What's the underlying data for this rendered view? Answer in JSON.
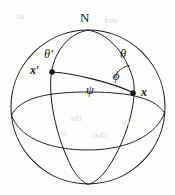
{
  "figure": {
    "type": "geometry-diagram",
    "background_color": "#fdfdfc",
    "stroke_color": "#1a1a1a",
    "canvas": {
      "width": 175,
      "height": 195
    }
  },
  "sphere": {
    "center_x": 88,
    "center_y": 107,
    "radius": 77,
    "name": "sphere-outline"
  },
  "poles": {
    "north": {
      "label": "N",
      "x": 88,
      "y": 30,
      "label_x": 80,
      "label_y": 11
    },
    "south": {
      "label": "",
      "x": 88,
      "y": 184
    }
  },
  "points": [
    {
      "id": "x-prime",
      "label": "x′",
      "x": 52,
      "y": 72,
      "label_x": 30,
      "label_y": 64,
      "dot_radius": 2.8
    },
    {
      "id": "x",
      "label": "x",
      "x": 133,
      "y": 93,
      "label_x": 141,
      "label_y": 86,
      "dot_radius": 2.8
    }
  ],
  "angles": [
    {
      "id": "theta-prime",
      "label": "θ′",
      "label_x": 44,
      "label_y": 48,
      "description": "polar angle of x-prime measured from north pole"
    },
    {
      "id": "theta",
      "label": "θ",
      "label_x": 120,
      "label_y": 48,
      "description": "polar angle of x measured from north pole"
    },
    {
      "id": "phi",
      "label": "ϕ",
      "label_x": 113,
      "label_y": 70,
      "description": "angle at x between meridian and geodesic"
    },
    {
      "id": "psi",
      "label": "ψ",
      "label_x": 86,
      "label_y": 84,
      "description": "great-circle angular separation between x-prime and x"
    }
  ],
  "curves": {
    "outline": "sphere-great-circle-boundary",
    "meridian_left": "meridian-through-x-prime",
    "meridian_right": "meridian-through-x",
    "equator": "equator-ellipse",
    "geodesic": "geodesic-arc-x-prime-to-x",
    "phi_arc": "phi-angle-arc-at-x"
  },
  "scan_artifacts": {
    "enabled": true,
    "lines": [
      {
        "text": "of",
        "x": 16,
        "y": 12
      },
      {
        "text": "and",
        "x": 104,
        "y": 16
      },
      {
        "text": "the",
        "x": 70,
        "y": 114
      },
      {
        "text": "in",
        "x": 122,
        "y": 118
      },
      {
        "text": "is",
        "x": 60,
        "y": 129
      },
      {
        "text": "that",
        "x": 92,
        "y": 131
      }
    ]
  }
}
